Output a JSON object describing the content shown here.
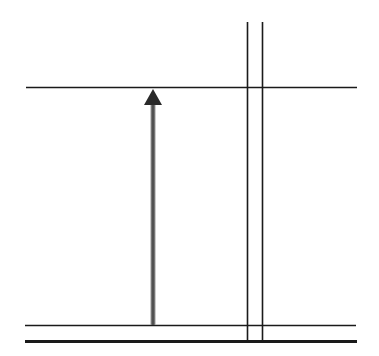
{
  "diagram": {
    "type": "line-drawing",
    "background": "#ffffff",
    "line_color": "#1a1a1a",
    "arrow_color": "#555555",
    "canvas": {
      "width": 379,
      "height": 356
    },
    "horizontal_lines": [
      {
        "name": "top-line",
        "x1": 26,
        "x2": 357,
        "y": 87.5,
        "width": 1.4
      },
      {
        "name": "bottom-thin-line",
        "x1": 25,
        "x2": 356,
        "y": 325.5,
        "width": 1.6
      },
      {
        "name": "bottom-thick-line",
        "x1": 25,
        "x2": 357,
        "y": 341.5,
        "width": 3.2
      }
    ],
    "vertical_lines": [
      {
        "name": "left-vertical-line",
        "x": 247.5,
        "y1": 22,
        "y2": 342,
        "width": 1.6
      },
      {
        "name": "right-vertical-line",
        "x": 262.5,
        "y1": 22,
        "y2": 342,
        "width": 1.6
      }
    ],
    "arrow": {
      "direction": "up",
      "x": 153,
      "y_tail": 325,
      "y_tip": 89,
      "shaft_width": 5,
      "head_width": 18,
      "head_length": 16
    }
  }
}
